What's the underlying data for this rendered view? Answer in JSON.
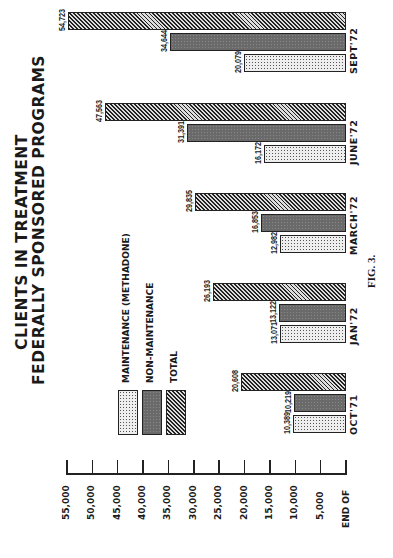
{
  "chart_data": {
    "type": "bar",
    "orientation": "rotated 90° counter-clockwise (grouped bar chart printed sideways)",
    "title": "CLIENTS IN TREATMENT",
    "subtitle": "FEDERALLY SPONSORED PROGRAMS",
    "caption": "FIG. 3.",
    "xlabel": "END OF",
    "ylabel": "",
    "categories": [
      "OCT'71",
      "JAN'72",
      "MARCH'72",
      "JUNE'72",
      "SEPT'72"
    ],
    "series": [
      {
        "name": "MAINTENANCE (METHADONE)",
        "pattern": "dotted-light",
        "values": [
          10389,
          13071,
          12982,
          16172,
          20079
        ],
        "labels": [
          "10,389",
          "13,071",
          "12,982",
          "16,172",
          "20,079"
        ]
      },
      {
        "name": "NON-MAINTENANCE",
        "pattern": "dark-gray",
        "values": [
          10219,
          13122,
          16853,
          31391,
          34644
        ],
        "labels": [
          "10,219",
          "13,122",
          "16,853",
          "31,391",
          "34,644"
        ]
      },
      {
        "name": "TOTAL",
        "pattern": "diagonal-hatch",
        "values": [
          20608,
          26193,
          29835,
          47563,
          54723
        ],
        "labels": [
          "20,608",
          "26,193",
          "29,835",
          "47,563",
          "54,723"
        ]
      }
    ],
    "ylim": [
      0,
      55000
    ],
    "yticks": [
      "5,000",
      "10,000",
      "15,000",
      "20,000",
      "25,000",
      "30,000",
      "35,000",
      "40,000",
      "45,000",
      "50,000",
      "55,000"
    ],
    "grid": false,
    "legend_position": "upper-left (in rotated frame)"
  },
  "legend": [
    {
      "label": "MAINTENANCE (METHADONE)"
    },
    {
      "label": "NON-MAINTENANCE"
    },
    {
      "label": "TOTAL"
    }
  ]
}
